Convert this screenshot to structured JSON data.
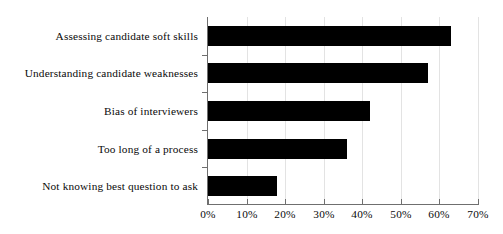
{
  "chart_data": {
    "type": "bar",
    "orientation": "horizontal",
    "title": "",
    "subtitle": "",
    "xlabel": "",
    "ylabel": "",
    "categories": [
      "Assessing candidate soft skills",
      "Understanding candidate weaknesses",
      "Bias of interviewers",
      "Too long of a process",
      "Not knowing best question to ask"
    ],
    "values": [
      63,
      57,
      42,
      36,
      18
    ],
    "value_suffix": "%",
    "xlim": [
      0,
      70
    ],
    "xticks": [
      0,
      10,
      20,
      30,
      40,
      50,
      60,
      70
    ],
    "xtick_labels": [
      "0%",
      "10%",
      "20%",
      "30%",
      "40%",
      "50%",
      "60%",
      "70%"
    ],
    "grid": "vertical",
    "legend": "none",
    "bar_color": "#000000",
    "gridline_color": "#e3e3e3",
    "axis_color": "#6f6f6f",
    "background_color": "#ffffff",
    "text_color": "#0a0a0a"
  }
}
